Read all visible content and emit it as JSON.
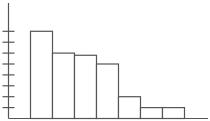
{
  "chart_data": {
    "type": "bar",
    "title": "",
    "xlabel": "",
    "ylabel": "",
    "categories": [
      "1",
      "2",
      "3",
      "4",
      "5",
      "6",
      "7"
    ],
    "values": [
      8,
      6,
      5.8,
      5,
      2,
      1,
      1
    ],
    "ylim": [
      0,
      8.5
    ],
    "y_ticks": [
      1,
      2,
      3,
      4,
      5,
      6,
      7,
      8
    ],
    "tick_labels_shown": false,
    "grid": false,
    "legend": null,
    "bar_fill": "#ffffff",
    "bar_stroke": "#555555",
    "axis_color": "#555555"
  },
  "layout": {
    "axis_x": 8.5,
    "axis_top": 3,
    "baseline_y": 118.5,
    "baseline_end_x": 208,
    "unit_px": 10.9,
    "bar_start_x": 30.5,
    "bar_width": 22,
    "tick_half_len": 6
  }
}
